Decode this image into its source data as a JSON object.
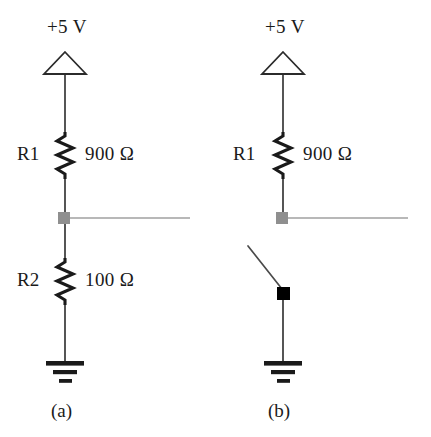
{
  "figure": {
    "colors": {
      "wire": "#2b2b2b",
      "node": "#8f8f8f",
      "output_line": "#a0a0a0",
      "switch_terminal": "#000000",
      "background": "#ffffff",
      "text": "#1a1a1a"
    }
  },
  "circuits": [
    {
      "caption": "(a)",
      "supply_label": "+5 V",
      "supply_symbol": "power-supply-triangle-icon",
      "ground_symbol": "ground-icon",
      "node_symbol": "junction-node-square",
      "components": [
        {
          "refdes": "R1",
          "value": "900 Ω",
          "symbol": "resistor-zigzag-icon"
        },
        {
          "refdes": "R2",
          "value": "100 Ω",
          "symbol": "resistor-zigzag-icon"
        }
      ]
    },
    {
      "caption": "(b)",
      "supply_label": "+5 V",
      "supply_symbol": "power-supply-triangle-icon",
      "ground_symbol": "ground-icon",
      "node_symbol": "junction-node-square",
      "components": [
        {
          "refdes": "R1",
          "value": "900 Ω",
          "symbol": "resistor-zigzag-icon"
        },
        {
          "refdes": "",
          "value": "",
          "symbol": "open-switch-icon"
        }
      ]
    }
  ],
  "labels": {
    "a_supply": "+5 V",
    "a_r1_refdes": "R1",
    "a_r1_value": "900 Ω",
    "a_r2_refdes": "R2",
    "a_r2_value": "100 Ω",
    "a_caption": "(a)",
    "b_supply": "+5 V",
    "b_r1_refdes": "R1",
    "b_r1_value": "900 Ω",
    "b_caption": "(b)"
  }
}
